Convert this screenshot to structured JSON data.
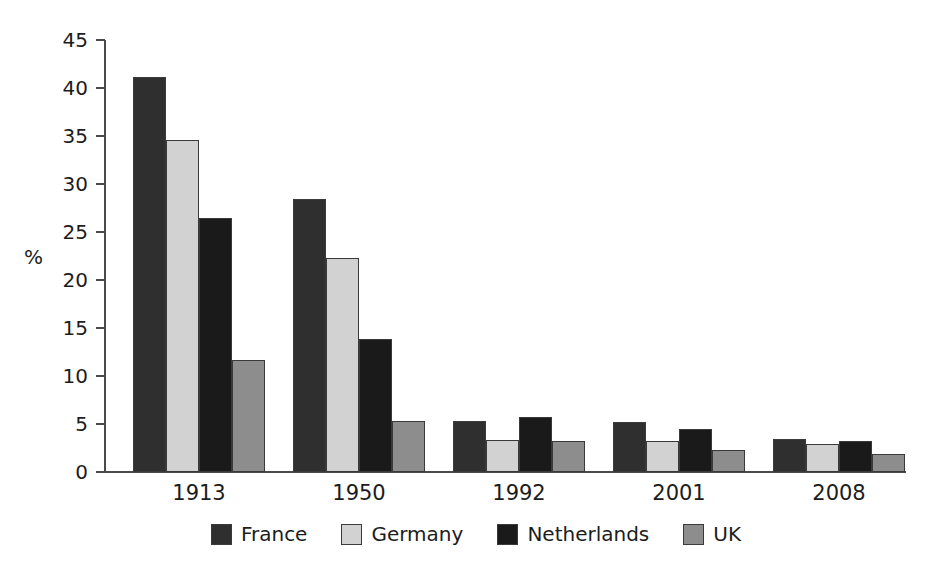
{
  "chart_data": {
    "type": "bar",
    "title": "",
    "xlabel": "",
    "ylabel": "%",
    "ylim": [
      0,
      45
    ],
    "ytick_step": 5,
    "yticks": [
      "45",
      "40",
      "35",
      "30",
      "25",
      "20",
      "15",
      "10",
      "5",
      "0"
    ],
    "grid": false,
    "legend_position": "bottom",
    "categories": [
      "1913",
      "1950",
      "1992",
      "2001",
      "2008"
    ],
    "series": [
      {
        "name": "France",
        "color": "#2f2f2f",
        "values": [
          41.1,
          28.4,
          5.3,
          5.2,
          3.4
        ]
      },
      {
        "name": "Germany",
        "color": "#d2d2d2",
        "values": [
          34.6,
          22.3,
          3.3,
          3.2,
          2.9
        ]
      },
      {
        "name": "Netherlands",
        "color": "#1a1a1a",
        "values": [
          26.5,
          13.9,
          5.7,
          4.5,
          3.2
        ]
      },
      {
        "name": "UK",
        "color": "#8d8d8d",
        "values": [
          11.7,
          5.3,
          3.2,
          2.3,
          1.9
        ]
      }
    ]
  },
  "colors": {
    "axis": "#4a4a4a",
    "text": "#1c1c1c",
    "background": "#ffffff",
    "bar_outline": "#3a3a3a"
  }
}
